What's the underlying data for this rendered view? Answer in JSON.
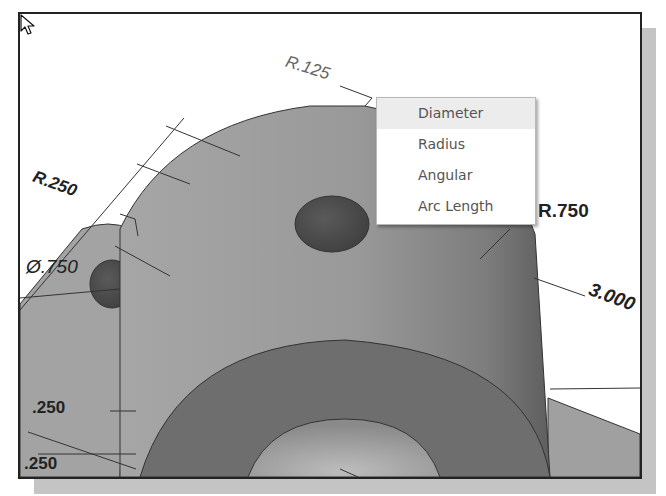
{
  "viewport": {
    "dimensions": {
      "r125": "R.125",
      "r250": "R.250",
      "dia750": "Ø.750",
      "r750": "R.750",
      "len3000": "3.000",
      "h250a": ".250",
      "h250b": ".250"
    },
    "colors": {
      "background": "#ffffff",
      "part_light": "#a8a8a8",
      "part_mid": "#8e8e8e",
      "part_dark": "#6a6a6a",
      "frame": "#222222",
      "shadow": "#c4c4c4"
    }
  },
  "context_menu": {
    "items": [
      {
        "label": "Diameter",
        "hover": true
      },
      {
        "label": "Radius",
        "hover": false
      },
      {
        "label": "Angular",
        "hover": false
      },
      {
        "label": "Arc Length",
        "hover": false
      }
    ]
  }
}
